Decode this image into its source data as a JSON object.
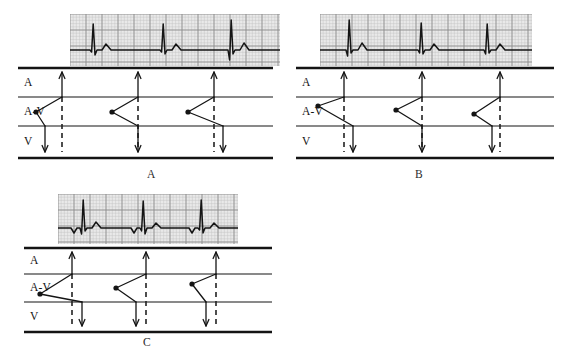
{
  "figure": {
    "type": "ladder-diagram-figure",
    "panel_count": 3
  },
  "tier_labels": {
    "atrial": "A",
    "av": "A-V",
    "ventricular": "V"
  },
  "colors": {
    "ink": "#1a1a1a",
    "grid_paper": "#e9e9e9",
    "grid_line": "#a9a9a9",
    "trace": "#141414",
    "dash": "#222222"
  },
  "panels": [
    {
      "id": "A",
      "caption": "A",
      "caption_x": 147,
      "caption_y": 169,
      "frame": {
        "x": 18,
        "y": 68,
        "w": 255,
        "h": 95
      },
      "strip": {
        "x": 70,
        "y": 14,
        "w": 210,
        "h": 52
      },
      "tier_label_x": 24,
      "tiers": {
        "top": 0,
        "a_av": 29,
        "av_v": 58,
        "bottom": 90
      },
      "beats": [
        {
          "origin_x": 18,
          "origin_y": 44,
          "atrial_x": 44,
          "vent_x": 27,
          "dash_x": 44
        },
        {
          "origin_x": 94,
          "origin_y": 44,
          "atrial_x": 120,
          "vent_x": 120,
          "dash_x": 120
        },
        {
          "origin_x": 170,
          "origin_y": 44,
          "atrial_x": 196,
          "vent_x": 205,
          "dash_x": 196
        }
      ],
      "ecg_beats": [
        {
          "x": 8,
          "p": "none",
          "q": -2,
          "r": 26,
          "s": -5,
          "t": 6
        },
        {
          "x": 78,
          "p": "none",
          "q": -2,
          "r": 26,
          "s": -4,
          "t": 6
        },
        {
          "x": 146,
          "p": "none",
          "q": -10,
          "r": 30,
          "s": -4,
          "t": 7
        }
      ]
    },
    {
      "id": "B",
      "caption": "B",
      "caption_x": 415,
      "caption_y": 169,
      "frame": {
        "x": 296,
        "y": 68,
        "w": 258,
        "h": 95
      },
      "strip": {
        "x": 320,
        "y": 14,
        "w": 212,
        "h": 52
      },
      "tier_label_x": 302,
      "tiers": {
        "top": 0,
        "a_av": 29,
        "av_v": 58,
        "bottom": 90
      },
      "beats": [
        {
          "origin_x": 22,
          "origin_y": 38,
          "atrial_x": 48,
          "vent_x": 57,
          "dash_x": 48
        },
        {
          "origin_x": 100,
          "origin_y": 42,
          "atrial_x": 126,
          "vent_x": 126,
          "dash_x": 126
        },
        {
          "origin_x": 178,
          "origin_y": 46,
          "atrial_x": 204,
          "vent_x": 196,
          "dash_x": 204
        }
      ],
      "ecg_beats": [
        {
          "x": 14,
          "p": "none",
          "q": -6,
          "r": 30,
          "s": -3,
          "t": 7
        },
        {
          "x": 86,
          "p": "none",
          "q": -3,
          "r": 27,
          "s": -4,
          "t": 6
        },
        {
          "x": 152,
          "p": "none",
          "q": -4,
          "r": 26,
          "s": -3,
          "t": 6
        }
      ]
    },
    {
      "id": "C",
      "caption": "C",
      "caption_x": 143,
      "caption_y": 337,
      "frame": {
        "x": 24,
        "y": 248,
        "w": 248,
        "h": 88
      },
      "strip": {
        "x": 58,
        "y": 194,
        "w": 180,
        "h": 50
      },
      "tier_label_x": 30,
      "tiers": {
        "top": 0,
        "a_av": 26,
        "av_v": 54,
        "bottom": 84
      },
      "beats": [
        {
          "origin_x": 16,
          "origin_y": 46,
          "atrial_x": 48,
          "vent_x": 58,
          "dash_x": 48
        },
        {
          "origin_x": 92,
          "origin_y": 40,
          "atrial_x": 122,
          "vent_x": 112,
          "dash_x": 122
        },
        {
          "origin_x": 168,
          "origin_y": 36,
          "atrial_x": 192,
          "vent_x": 182,
          "dash_x": 192
        }
      ],
      "ecg_beats": [
        {
          "x": 10,
          "p": "inverted",
          "q": -6,
          "r": 28,
          "s": -3,
          "t": 6
        },
        {
          "x": 70,
          "p": "inverted",
          "q": -3,
          "r": 27,
          "s": -6,
          "t": 5
        },
        {
          "x": 128,
          "p": "inverted",
          "q": -2,
          "r": 28,
          "s": -5,
          "t": 5
        }
      ]
    }
  ]
}
